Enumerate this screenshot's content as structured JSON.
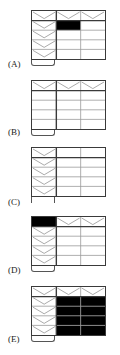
{
  "figure": {
    "grid": {
      "columns": 3,
      "rows": 5,
      "header_row": true,
      "header_column": true
    },
    "colors": {
      "line": "#3a3a3a",
      "inner_line": "#9a9a9a",
      "chevron": "#a0a0a0",
      "fill": "#000000"
    }
  },
  "options": [
    {
      "label": "(A)",
      "top": 10,
      "header_chevrons": true,
      "column_chevrons": true,
      "filled": [
        [
          1,
          1
        ]
      ],
      "bottom": "tab"
    },
    {
      "label": "(B)",
      "top": 80,
      "header_chevrons": true,
      "column_chevrons": false,
      "filled": [],
      "bottom": "tab"
    },
    {
      "label": "(C)",
      "top": 147,
      "header_chevrons": false,
      "column_chevrons": true,
      "filled": [],
      "bottom": "ticks"
    },
    {
      "label": "(D)",
      "top": 216,
      "header_chevrons": true,
      "column_chevrons": true,
      "filled": [
        [
          0,
          0
        ]
      ],
      "bottom": "tab"
    },
    {
      "label": "(E)",
      "top": 286,
      "header_chevrons": true,
      "column_chevrons": true,
      "filled": [
        [
          1,
          1
        ],
        [
          1,
          2
        ],
        [
          2,
          1
        ],
        [
          2,
          2
        ],
        [
          3,
          1
        ],
        [
          3,
          2
        ],
        [
          4,
          1
        ],
        [
          4,
          2
        ]
      ],
      "bottom": "tab"
    }
  ]
}
